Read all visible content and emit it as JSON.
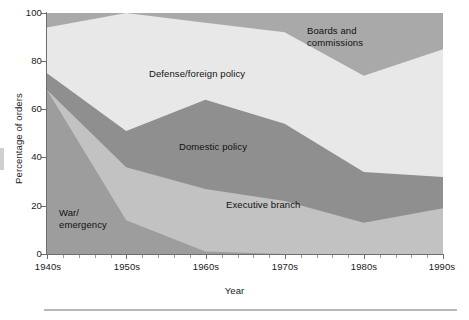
{
  "chart_data": {
    "type": "area",
    "stacked": true,
    "title": "",
    "xlabel": "Year",
    "ylabel": "Percentage of orders",
    "categories": [
      "1940s",
      "1950s",
      "1960s",
      "1970s",
      "1980s",
      "1990s"
    ],
    "x_values": [
      0,
      1,
      2,
      3,
      4,
      5
    ],
    "xlim": [
      0,
      5
    ],
    "ylim": [
      0,
      100
    ],
    "y_ticks": [
      0,
      20,
      40,
      60,
      80,
      100
    ],
    "y_tick_labels": [
      "0",
      "20",
      "40",
      "60",
      "80",
      "100"
    ],
    "x_tick_labels": [
      "1940s",
      "1950s",
      "1960s",
      "1970s",
      "1980s",
      "1990s"
    ],
    "x_minor_ticks_per_interval": 4,
    "grid": false,
    "legend": "inline-area-labels",
    "series": [
      {
        "name": "War/emergency",
        "color": "#9d9d9d",
        "values": [
          68,
          14,
          1,
          0,
          0,
          0
        ],
        "label_position": {
          "x": 0.07,
          "y": 18
        }
      },
      {
        "name": "Executive branch",
        "color": "#c2c2c2",
        "values": [
          0,
          22,
          26,
          22,
          13,
          19
        ],
        "cumulative_top": [
          68,
          36,
          27,
          22,
          13,
          19
        ],
        "label_position": {
          "x": 2.5,
          "y": 17
        }
      },
      {
        "name": "Domestic policy",
        "color": "#8f8f8f",
        "values": [
          7,
          15,
          37,
          32,
          21,
          13
        ],
        "cumulative_top": [
          75,
          51,
          64,
          54,
          34,
          32
        ],
        "label_position": {
          "x": 1.85,
          "y": 45
        }
      },
      {
        "name": "Defense/foreign policy",
        "color": "#e8e8e8",
        "values": [
          19,
          49,
          32,
          38,
          40,
          53
        ],
        "cumulative_top": [
          94,
          100,
          96,
          92,
          74,
          85
        ],
        "label_position": {
          "x": 1.5,
          "y": 78
        }
      },
      {
        "name": "Boards and commissions",
        "color": "#a9a9a9",
        "values": [
          6,
          0,
          4,
          8,
          26,
          15
        ],
        "cumulative_top": [
          100,
          100,
          100,
          100,
          100,
          100
        ],
        "label_position": {
          "x": 3.9,
          "y": 92
        }
      }
    ]
  },
  "axis": {
    "y_title": "Percentage of orders",
    "x_title": "Year",
    "y_tick_labels": [
      "100",
      "80",
      "60",
      "40",
      "20",
      "0"
    ],
    "x_tick_labels": [
      "1940s",
      "1950s",
      "1960s",
      "1970s",
      "1980s",
      "1990s"
    ]
  },
  "labels": {
    "boards": "Boards and\ncommissions",
    "defense": "Defense/foreign policy",
    "domestic": "Domestic policy",
    "executive": "Executive branch",
    "war": "War/\nemergency"
  },
  "colors": {
    "boards": "#a9a9a9",
    "defense": "#e8e8e8",
    "domestic": "#8f8f8f",
    "executive": "#c2c2c2",
    "war": "#9d9d9d",
    "axis": "#6e6e6e",
    "text": "#111111",
    "rule": "#b9b9b9"
  }
}
